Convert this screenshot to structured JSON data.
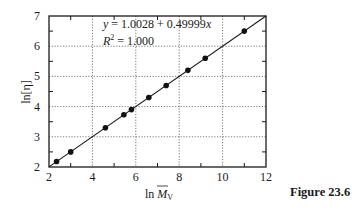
{
  "chart_data": {
    "type": "scatter",
    "title": "",
    "xlabel": "ln M̄v",
    "ylabel": "ln[η]",
    "xlim": [
      2,
      12
    ],
    "ylim": [
      2,
      7
    ],
    "x_ticks": [
      2,
      4,
      6,
      8,
      10,
      12
    ],
    "y_ticks": [
      2,
      3,
      4,
      5,
      6,
      7
    ],
    "x_minor_ticks": [
      3,
      5,
      7,
      9,
      11
    ],
    "y_minor_ticks": [
      2.5,
      3.5,
      4.5,
      5.5,
      6.5
    ],
    "grid": true,
    "grid_style": "dotted",
    "legend": null,
    "series": [
      {
        "name": "data",
        "marker": "filled-circle",
        "x": [
          2.35,
          3.0,
          4.6,
          5.45,
          5.8,
          6.6,
          7.4,
          8.4,
          9.2,
          11.0
        ],
        "y": [
          2.18,
          2.5,
          3.3,
          3.73,
          3.9,
          4.3,
          4.7,
          5.2,
          5.6,
          6.5
        ]
      },
      {
        "name": "fit",
        "type": "line",
        "intercept": 1.0028,
        "slope": 0.49999,
        "x": [
          2,
          12
        ],
        "y": [
          2.0028,
          7.0027
        ]
      }
    ],
    "annotations": [
      "y = 1.0028 + 0.49999x",
      "R² = 1.000"
    ]
  },
  "labels": {
    "equation_y": "y",
    "equation_rest": " = 1.0028 + 0.49999",
    "equation_x": "x",
    "r2_R": "R",
    "r2_sup": "2",
    "r2_rest": " = 1.000",
    "xlabel_ln": "ln ",
    "xlabel_M": "M",
    "xlabel_sub": "V",
    "ylabel": "ln[η]",
    "caption": "Figure 23.6"
  },
  "colors": {
    "axis": "#1a1a1a",
    "grid": "#555555",
    "marker": "#111111",
    "line": "#1a1a1a"
  }
}
